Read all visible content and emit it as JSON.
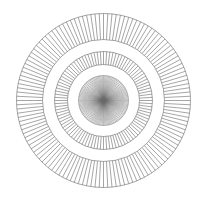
{
  "figure": {
    "width": 205,
    "height": 198,
    "background": "#ffffff",
    "stroke_color": "#6a6a6a",
    "center": {
      "x": 103.5,
      "y": 100.5
    },
    "rings": [
      {
        "name": "outer-ring",
        "r_outer": 87,
        "r_inner": 61,
        "spokes": 128,
        "stroke_width": 0.6
      },
      {
        "name": "middle-ring",
        "r_outer": 49,
        "r_inner": 36,
        "spokes": 96,
        "stroke_width": 0.6
      },
      {
        "name": "inner-disc",
        "r_outer": 25,
        "r_inner": 0,
        "spokes": 120,
        "stroke_width": 0.45
      }
    ]
  }
}
